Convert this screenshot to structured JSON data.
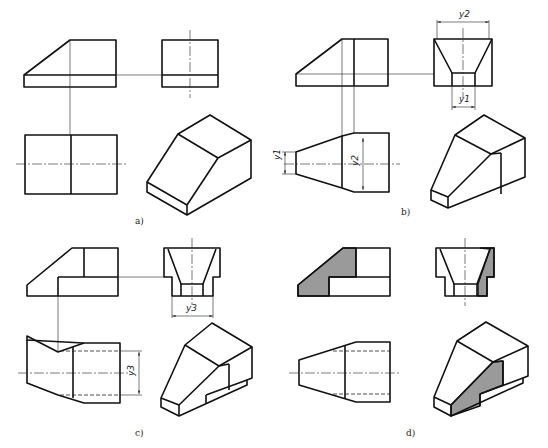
{
  "figure": {
    "panels": [
      {
        "id": "a",
        "label": "a)"
      },
      {
        "id": "b",
        "label": "b)"
      },
      {
        "id": "c",
        "label": "c)"
      },
      {
        "id": "d",
        "label": "d)"
      }
    ],
    "dimensions": {
      "y1": "y1",
      "y2": "y2",
      "y3": "y3"
    },
    "colors": {
      "line": "#111111",
      "section_fill": "#9a9a9a",
      "background": "#ffffff"
    }
  }
}
